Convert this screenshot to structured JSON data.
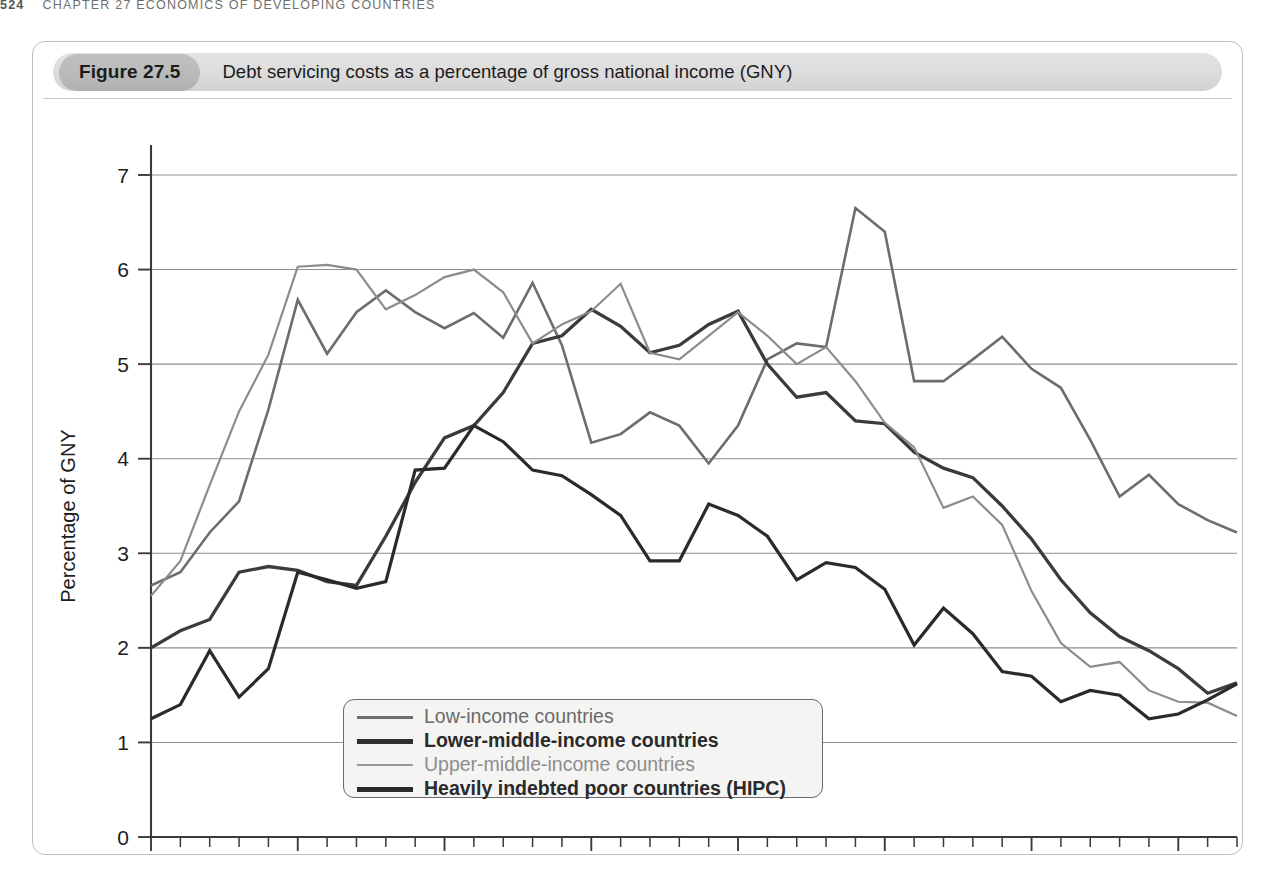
{
  "running_head": {
    "folio": "524",
    "text": "CHAPTER 27  ECONOMICS OF DEVELOPING COUNTRIES"
  },
  "figure": {
    "label": "Figure 27.5",
    "caption": "Debt servicing costs as a percentage of gross national income (GNY)"
  },
  "chart_data": {
    "type": "line",
    "title": "Debt servicing costs as a percentage of gross national income (GNY)",
    "xlabel": "",
    "ylabel": "Percentage of GNY",
    "xlim": [
      1975,
      2012
    ],
    "ylim": [
      0,
      7.3
    ],
    "yticks": [
      0,
      1,
      2,
      3,
      4,
      5,
      6,
      7
    ],
    "ytick_labels": [
      "0",
      "1",
      "2",
      "3",
      "4",
      "5",
      "6",
      "7"
    ],
    "xticks": [
      1975,
      1980,
      1985,
      1990,
      1995,
      2000,
      2005,
      2010
    ],
    "xtick_labels": [
      "1975",
      "1980",
      "1985",
      "1990",
      "1995",
      "2000",
      "2005",
      "2010"
    ],
    "minor_xticks_every": 1,
    "grid": "horizontal",
    "legend_position": "inside-bottom-left",
    "x": [
      1975,
      1976,
      1977,
      1978,
      1979,
      1980,
      1981,
      1982,
      1983,
      1984,
      1985,
      1986,
      1987,
      1988,
      1989,
      1990,
      1991,
      1992,
      1993,
      1994,
      1995,
      1996,
      1997,
      1998,
      1999,
      2000,
      2001,
      2002,
      2003,
      2004,
      2005,
      2006,
      2007,
      2008,
      2009,
      2010,
      2011,
      2012
    ],
    "series": [
      {
        "name": "Low-income countries",
        "color": "#6d6d6d",
        "width": 2.6,
        "values": [
          2.66,
          2.8,
          3.22,
          3.55,
          4.52,
          5.68,
          5.11,
          5.55,
          5.78,
          5.55,
          5.38,
          5.54,
          5.28,
          5.86,
          5.2,
          4.17,
          4.26,
          4.49,
          4.35,
          3.95,
          4.35,
          5.05,
          5.22,
          5.18,
          6.65,
          6.4,
          4.82,
          4.82,
          5.05,
          5.29,
          4.95,
          4.75,
          4.2,
          3.6,
          3.83,
          3.52,
          3.35,
          3.22
        ]
      },
      {
        "name": "Lower-middle-income countries",
        "color": "#3b3b3b",
        "width": 3.3,
        "values": [
          2.0,
          2.18,
          2.3,
          2.8,
          2.86,
          2.82,
          2.7,
          2.66,
          3.18,
          3.75,
          4.22,
          4.35,
          4.7,
          5.22,
          5.3,
          5.58,
          5.4,
          5.12,
          5.2,
          5.42,
          5.56,
          5.0,
          4.65,
          4.7,
          4.4,
          4.37,
          4.07,
          3.9,
          3.8,
          3.5,
          3.15,
          2.72,
          2.37,
          2.12,
          1.97,
          1.78,
          1.52,
          1.63
        ]
      },
      {
        "name": "Upper-middle-income countries",
        "color": "#8c8c8c",
        "width": 2.2,
        "values": [
          2.55,
          2.92,
          3.72,
          4.5,
          5.1,
          6.03,
          6.05,
          6.0,
          5.58,
          5.73,
          5.92,
          6.0,
          5.76,
          5.22,
          5.42,
          5.56,
          5.85,
          5.12,
          5.05,
          5.3,
          5.55,
          5.3,
          5.0,
          5.18,
          4.82,
          4.38,
          4.12,
          3.48,
          3.6,
          3.3,
          2.6,
          2.05,
          1.8,
          1.85,
          1.55,
          1.43,
          1.42,
          1.28
        ]
      },
      {
        "name": "Heavily indebted poor countries (HIPC)",
        "color": "#2a2a2a",
        "width": 3.2,
        "values": [
          1.25,
          1.4,
          1.97,
          1.48,
          1.78,
          2.8,
          2.72,
          2.63,
          2.7,
          3.88,
          3.9,
          4.35,
          4.18,
          3.88,
          3.82,
          3.62,
          3.4,
          2.92,
          2.92,
          3.52,
          3.4,
          3.18,
          2.72,
          2.9,
          2.85,
          2.62,
          2.03,
          2.42,
          2.15,
          1.75,
          1.7,
          1.43,
          1.55,
          1.5,
          1.25,
          1.3,
          1.45,
          1.62
        ]
      }
    ]
  },
  "legend": {
    "items": [
      {
        "label": "Low-income countries",
        "color": "#6d6d6d",
        "width": 3,
        "weight": "normal"
      },
      {
        "label": "Lower-middle-income countries",
        "color": "#2f2f2f",
        "width": 5,
        "weight": "bold"
      },
      {
        "label": "Upper-middle-income countries",
        "color": "#9a9a9a",
        "width": 2.5,
        "weight": "normal"
      },
      {
        "label": "Heavily indebted poor countries (HIPC)",
        "color": "#2a2a2a",
        "width": 5,
        "weight": "bold"
      }
    ]
  }
}
